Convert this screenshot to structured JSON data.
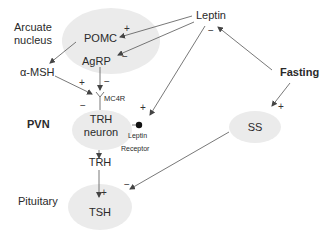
{
  "diagram": {
    "regions": {
      "arcuate": "Arcuate\nnucleus",
      "arcuate_line1": "Arcuate",
      "arcuate_line2": "nucleus",
      "pvn": "PVN",
      "pituitary": "Pituitary"
    },
    "nodes": {
      "pomc": "POMC",
      "agrp": "AgRP",
      "leptin": "Leptin",
      "fasting": "Fasting",
      "alpha_msh": "α-MSH",
      "mc4r": "MC4R",
      "trh_neuron_line1": "TRH",
      "trh_neuron_line2": "neuron",
      "trh": "TRH",
      "tsh": "TSH",
      "ss": "SS",
      "leptin_receptor_line1": "Leptin",
      "leptin_receptor_line2": "Receptor"
    },
    "signs": {
      "leptin_to_pomc": "+",
      "leptin_to_agrp": "−",
      "leptin_minus": "−",
      "msh_to_mc4r": "+",
      "agrp_to_mc4r": "−",
      "mc4r_minus": "−",
      "leptin_to_receptor": "+",
      "fasting_to_ss": "+",
      "trh_to_tsh": "+",
      "ss_to_tsh": "−"
    },
    "colors": {
      "blob": "#ebebeb",
      "line": "#555555",
      "text": "#2a2a2a"
    }
  }
}
